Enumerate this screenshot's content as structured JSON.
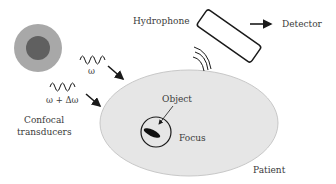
{
  "diagram": {
    "labels": {
      "hydrophone": "Hydrophone",
      "detector": "Detector",
      "omega": "ω",
      "omega_plus_delta": "ω + Δω",
      "confocal_line1": "Confocal",
      "confocal_line2": "transducers",
      "object": "Object",
      "focus": "Focus",
      "patient": "Patient"
    },
    "colors": {
      "transducer_outer": "#a8a8a8",
      "transducer_inner": "#606060",
      "patient_fill": "#e6e6e6",
      "patient_stroke": "#c8c8c8",
      "ink": "#1a1a1a",
      "text": "#3a3a3a"
    },
    "icons": {
      "transducer": "concentric-circles-icon",
      "wave": "sine-wave-icon",
      "arrow": "arrow-icon",
      "hydrophone": "rectangle-probe-icon",
      "sound-waves": "sound-arc-icon"
    }
  }
}
